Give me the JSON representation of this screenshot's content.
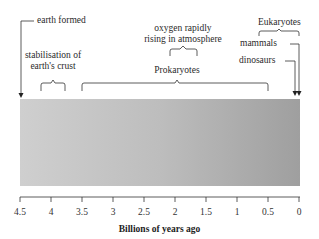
{
  "diagram": {
    "events": {
      "earth_formed": "earth formed",
      "stabilisation": "stabilisation of\nearth's crust",
      "stabilisation_l1": "stabilisation of",
      "stabilisation_l2": "earth's crust",
      "oxygen_l1": "oxygen rapidly",
      "oxygen_l2": "rising in atmosphere",
      "prokaryotes": "Prokaryotes",
      "eukaryotes": "Eukaryotes",
      "mammals": "mammals",
      "dinosaurs": "dinosaurs"
    },
    "axis": {
      "label": "Billions of years ago",
      "ticks": [
        "4.5",
        "4",
        "3.5",
        "3",
        "2.5",
        "2",
        "1.5",
        "1",
        "0.5",
        "0"
      ]
    },
    "colors": {
      "bar_start": "#cfcfcf",
      "bar_end": "#9f9f9f"
    }
  }
}
